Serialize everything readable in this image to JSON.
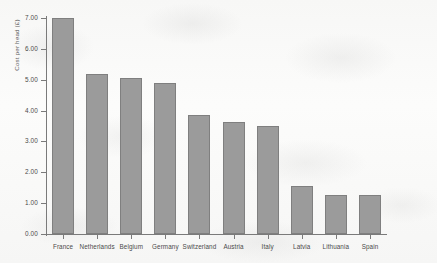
{
  "chart_data": {
    "type": "bar",
    "title": "",
    "xlabel": "",
    "ylabel": "Cost per head (£)",
    "categories": [
      "France",
      "Netherlands",
      "Belgium",
      "Germany",
      "Switzerland",
      "Austria",
      "Italy",
      "Latvia",
      "Lithuania",
      "Spain"
    ],
    "values": [
      7.0,
      5.2,
      5.05,
      4.88,
      3.87,
      3.62,
      3.5,
      1.57,
      1.27,
      1.25
    ],
    "ylim": [
      0.0,
      7.0
    ],
    "ytick_labels": [
      "0.00",
      "1.00",
      "2.00",
      "3.00",
      "4.00",
      "5.00",
      "6.00",
      "7.00"
    ],
    "ytick_values": [
      0.0,
      1.0,
      2.0,
      3.0,
      4.0,
      5.0,
      6.0,
      7.0
    ],
    "grid": false,
    "legend": null,
    "bar_color": "#9b9b9b",
    "bar_edge_color": "#7f7f7f",
    "axis_color": "#7a7a7a",
    "background_color": "#fbfbfa"
  }
}
